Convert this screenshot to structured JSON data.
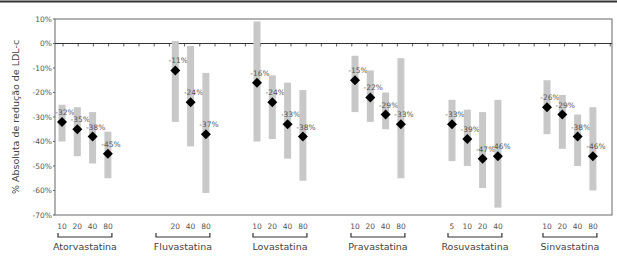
{
  "chart_data": {
    "type": "scatter",
    "title": "",
    "ylabel": "% Absoluta de redução de LDL-c",
    "xlabel": "",
    "ylim": [
      -70,
      10
    ],
    "yticks": [
      "10%",
      "0%",
      "-10%",
      "-20%",
      "-30%",
      "-40%",
      "-50%",
      "-60%",
      "-70%"
    ],
    "grid": false,
    "legend": null,
    "range_color": "#c8c8c8",
    "marker_color": "#000000",
    "groups": [
      {
        "name": "Atorvastatina",
        "doses": [
          "10",
          "20",
          "40",
          "80"
        ],
        "values": [
          -32,
          -35,
          -38,
          -45
        ],
        "labels": [
          "-32%",
          "-35%",
          "-38%",
          "-45%"
        ],
        "ranges": [
          [
            -25,
            -40
          ],
          [
            -26,
            -46
          ],
          [
            -28,
            -49
          ],
          [
            -36,
            -55
          ]
        ]
      },
      {
        "name": "Fluvastatina",
        "doses": [
          "20",
          "40",
          "80"
        ],
        "values": [
          -11,
          -24,
          -37
        ],
        "labels": [
          "-11%",
          "-24%",
          "-37%"
        ],
        "ranges": [
          [
            1,
            -32
          ],
          [
            -1,
            -42
          ],
          [
            -12,
            -61
          ]
        ]
      },
      {
        "name": "Lovastatina",
        "doses": [
          "10",
          "20",
          "40",
          "80"
        ],
        "values": [
          -16,
          -24,
          -33,
          -38
        ],
        "labels": [
          "-16%",
          "-24%",
          "-33%",
          "-38%"
        ],
        "ranges": [
          [
            9,
            -40
          ],
          [
            -13,
            -39
          ],
          [
            -16,
            -47
          ],
          [
            -19,
            -56
          ]
        ]
      },
      {
        "name": "Pravastatina",
        "doses": [
          "10",
          "20",
          "40",
          "80"
        ],
        "values": [
          -15,
          -22,
          -29,
          -33
        ],
        "labels": [
          "-15%",
          "-22%",
          "-29%",
          "-33%"
        ],
        "ranges": [
          [
            -5,
            -28
          ],
          [
            -11,
            -32
          ],
          [
            -20,
            -35
          ],
          [
            -6,
            -55
          ]
        ]
      },
      {
        "name": "Rosuvastatina",
        "doses": [
          "5",
          "10",
          "20",
          "40"
        ],
        "values": [
          -33,
          -39,
          -47,
          -46
        ],
        "labels": [
          "-33%",
          "-39%",
          "-47%",
          "-46%"
        ],
        "ranges": [
          [
            -23,
            -48
          ],
          [
            -27,
            -50
          ],
          [
            -28,
            -59
          ],
          [
            -23,
            -67
          ]
        ]
      },
      {
        "name": "Sinvastatina",
        "doses": [
          "10",
          "20",
          "40",
          "80"
        ],
        "values": [
          -26,
          -29,
          -38,
          -46
        ],
        "labels": [
          "-26%",
          "-29%",
          "-38%",
          "-46%"
        ],
        "ranges": [
          [
            -15,
            -37
          ],
          [
            -21,
            -43
          ],
          [
            -29,
            -50
          ],
          [
            -26,
            -60
          ]
        ]
      }
    ]
  }
}
